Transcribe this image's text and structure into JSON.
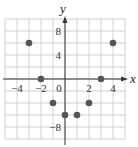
{
  "chart_data": {
    "type": "scatter",
    "title": "",
    "xlabel": "x",
    "ylabel": "y",
    "xlim": [
      -5,
      5
    ],
    "ylim": [
      -10,
      10
    ],
    "grid": true,
    "x_ticks": [
      -4,
      -2,
      0,
      2,
      4
    ],
    "y_ticks": [
      8,
      4,
      -8
    ],
    "x_tick_labels": [
      "−4",
      "−2",
      "0",
      "2",
      "4"
    ],
    "y_tick_labels": [
      "8",
      "4",
      "−8"
    ],
    "series": [
      {
        "name": "points",
        "x": [
          -3,
          -2,
          -1,
          0,
          1,
          2,
          3,
          4
        ],
        "y": [
          6,
          0,
          -4,
          -6,
          -6,
          -4,
          0,
          6
        ]
      }
    ],
    "colors": {
      "grid": "#d0d0d0",
      "axis": "#333333",
      "point": "#555555"
    }
  }
}
